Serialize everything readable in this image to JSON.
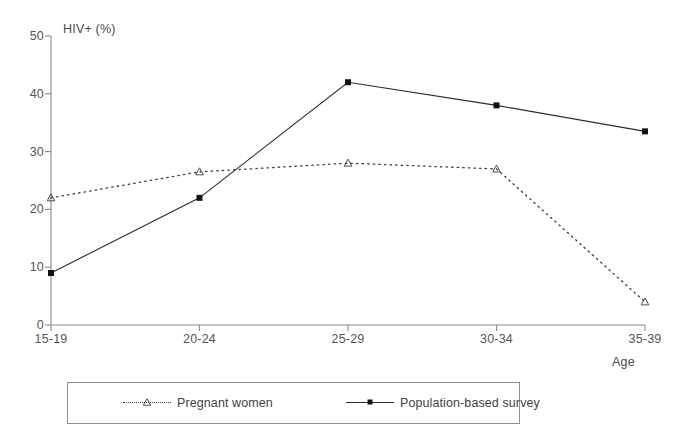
{
  "chart_data": {
    "type": "line",
    "title": "",
    "xlabel": "Age",
    "ylabel": "HIV+ (%)",
    "categories": [
      "15-19",
      "20-24",
      "25-29",
      "30-34",
      "35-39"
    ],
    "ylim": [
      0,
      50
    ],
    "yticks": [
      0,
      10,
      20,
      30,
      40,
      50
    ],
    "grid": false,
    "legend_position": "bottom",
    "series": [
      {
        "name": "Pregnant women",
        "marker": "open-triangle",
        "linestyle": "dotted",
        "color": "#3a3a3a",
        "values": [
          22,
          26.5,
          28,
          27,
          4
        ]
      },
      {
        "name": "Population-based survey",
        "marker": "filled-square",
        "linestyle": "solid",
        "color": "#2b2b2b",
        "values": [
          9,
          22,
          42,
          38,
          33.5
        ]
      }
    ]
  },
  "axes": {
    "y_title": "HIV+ (%)",
    "x_title": "Age",
    "y_tick_labels": [
      "0",
      "10",
      "20",
      "30",
      "40",
      "50"
    ],
    "x_tick_labels": [
      "15-19",
      "20-24",
      "25-29",
      "30-34",
      "35-39"
    ]
  },
  "legend": {
    "items": [
      {
        "label": "Pregnant women"
      },
      {
        "label": "Population-based survey"
      }
    ]
  }
}
